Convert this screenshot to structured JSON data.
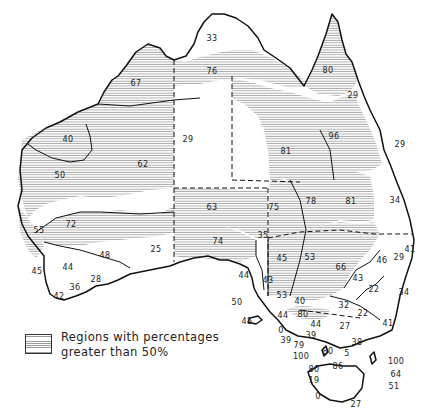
{
  "figure": {
    "type": "choropleth-map",
    "colors": {
      "hatched_fill": "#9a9a9a",
      "outline": "#111111",
      "background": "#ffffff"
    }
  },
  "legend": {
    "line1": "Regions with percentages",
    "line2": "greater than 50%",
    "swatch": "horizontal-hatch"
  },
  "labels": [
    {
      "text": "33",
      "x": 212,
      "y": 39
    },
    {
      "text": "80",
      "x": 328,
      "y": 71
    },
    {
      "text": "67",
      "x": 136,
      "y": 84
    },
    {
      "text": "76",
      "x": 212,
      "y": 72
    },
    {
      "text": "29",
      "x": 353,
      "y": 96
    },
    {
      "text": "29",
      "x": 188,
      "y": 140
    },
    {
      "text": "96",
      "x": 334,
      "y": 137
    },
    {
      "text": "81",
      "x": 286,
      "y": 152
    },
    {
      "text": "29",
      "x": 400,
      "y": 145
    },
    {
      "text": "40",
      "x": 68,
      "y": 140
    },
    {
      "text": "62",
      "x": 143,
      "y": 165
    },
    {
      "text": "50",
      "x": 60,
      "y": 176
    },
    {
      "text": "34",
      "x": 395,
      "y": 201
    },
    {
      "text": "78",
      "x": 311,
      "y": 202
    },
    {
      "text": "81",
      "x": 351,
      "y": 202
    },
    {
      "text": "63",
      "x": 212,
      "y": 208
    },
    {
      "text": "75",
      "x": 274,
      "y": 208
    },
    {
      "text": "72",
      "x": 71,
      "y": 225
    },
    {
      "text": "55",
      "x": 39,
      "y": 231
    },
    {
      "text": "35",
      "x": 263,
      "y": 236
    },
    {
      "text": "74",
      "x": 218,
      "y": 242
    },
    {
      "text": "41",
      "x": 410,
      "y": 250
    },
    {
      "text": "48",
      "x": 105,
      "y": 256
    },
    {
      "text": "25",
      "x": 156,
      "y": 250
    },
    {
      "text": "29",
      "x": 399,
      "y": 258
    },
    {
      "text": "53",
      "x": 310,
      "y": 258
    },
    {
      "text": "45",
      "x": 282,
      "y": 259
    },
    {
      "text": "46",
      "x": 382,
      "y": 261
    },
    {
      "text": "44",
      "x": 68,
      "y": 268
    },
    {
      "text": "66",
      "x": 341,
      "y": 268
    },
    {
      "text": "45",
      "x": 37,
      "y": 272
    },
    {
      "text": "43",
      "x": 358,
      "y": 279
    },
    {
      "text": "44",
      "x": 244,
      "y": 276
    },
    {
      "text": "28",
      "x": 96,
      "y": 280
    },
    {
      "text": "43",
      "x": 268,
      "y": 281
    },
    {
      "text": "22",
      "x": 374,
      "y": 290
    },
    {
      "text": "36",
      "x": 75,
      "y": 288
    },
    {
      "text": "42",
      "x": 59,
      "y": 297
    },
    {
      "text": "34",
      "x": 404,
      "y": 293
    },
    {
      "text": "53",
      "x": 282,
      "y": 296
    },
    {
      "text": "40",
      "x": 300,
      "y": 302
    },
    {
      "text": "50",
      "x": 237,
      "y": 303
    },
    {
      "text": "32",
      "x": 344,
      "y": 306
    },
    {
      "text": "22",
      "x": 363,
      "y": 314
    },
    {
      "text": "44",
      "x": 283,
      "y": 316
    },
    {
      "text": "80",
      "x": 303,
      "y": 315
    },
    {
      "text": "45",
      "x": 247,
      "y": 322
    },
    {
      "text": "44",
      "x": 316,
      "y": 325
    },
    {
      "text": "0",
      "x": 281,
      "y": 331
    },
    {
      "text": "27",
      "x": 345,
      "y": 327
    },
    {
      "text": "41",
      "x": 388,
      "y": 324
    },
    {
      "text": "39",
      "x": 311,
      "y": 336
    },
    {
      "text": "39",
      "x": 286,
      "y": 341
    },
    {
      "text": "38",
      "x": 357,
      "y": 343
    },
    {
      "text": "79",
      "x": 299,
      "y": 346
    },
    {
      "text": "80",
      "x": 328,
      "y": 352
    },
    {
      "text": "5",
      "x": 347,
      "y": 354
    },
    {
      "text": "100",
      "x": 301,
      "y": 357
    },
    {
      "text": "100",
      "x": 396,
      "y": 362
    },
    {
      "text": "80",
      "x": 314,
      "y": 370
    },
    {
      "text": "86",
      "x": 338,
      "y": 367
    },
    {
      "text": "64",
      "x": 396,
      "y": 375
    },
    {
      "text": "19",
      "x": 314,
      "y": 381
    },
    {
      "text": "51",
      "x": 394,
      "y": 387
    },
    {
      "text": "0",
      "x": 318,
      "y": 397
    },
    {
      "text": "27",
      "x": 356,
      "y": 405
    }
  ]
}
